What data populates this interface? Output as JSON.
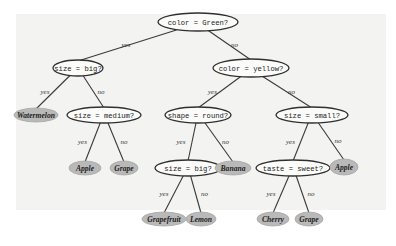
{
  "diagram": {
    "type": "decision-tree",
    "nodes": [
      {
        "id": "n0",
        "kind": "question",
        "label": "color = Green?"
      },
      {
        "id": "n1",
        "kind": "question",
        "label": "size = big?"
      },
      {
        "id": "n2",
        "kind": "question",
        "label": "color = yellow?"
      },
      {
        "id": "n3",
        "kind": "leaf",
        "label": "Watermelon"
      },
      {
        "id": "n4",
        "kind": "question",
        "label": "size = medium?"
      },
      {
        "id": "n5",
        "kind": "question",
        "label": "shape = round?"
      },
      {
        "id": "n6",
        "kind": "question",
        "label": "size = small?"
      },
      {
        "id": "n7",
        "kind": "leaf",
        "label": "Apple"
      },
      {
        "id": "n8",
        "kind": "leaf",
        "label": "Grape"
      },
      {
        "id": "n9",
        "kind": "question",
        "label": "size = big?"
      },
      {
        "id": "n10",
        "kind": "leaf",
        "label": "Banana"
      },
      {
        "id": "n11",
        "kind": "question",
        "label": "taste = sweet?"
      },
      {
        "id": "n12",
        "kind": "leaf",
        "label": "Apple"
      },
      {
        "id": "n13",
        "kind": "leaf",
        "label": "Grapefruit"
      },
      {
        "id": "n14",
        "kind": "leaf",
        "label": "Lemon"
      },
      {
        "id": "n15",
        "kind": "leaf",
        "label": "Cherry"
      },
      {
        "id": "n16",
        "kind": "leaf",
        "label": "Grape"
      }
    ],
    "edges": [
      {
        "from": "n0",
        "to": "n1",
        "label": "yes"
      },
      {
        "from": "n0",
        "to": "n2",
        "label": "no"
      },
      {
        "from": "n1",
        "to": "n3",
        "label": "yes"
      },
      {
        "from": "n1",
        "to": "n4",
        "label": "no"
      },
      {
        "from": "n2",
        "to": "n5",
        "label": "yes"
      },
      {
        "from": "n2",
        "to": "n6",
        "label": "no"
      },
      {
        "from": "n4",
        "to": "n7",
        "label": "yes"
      },
      {
        "from": "n4",
        "to": "n8",
        "label": "no"
      },
      {
        "from": "n5",
        "to": "n9",
        "label": "yes"
      },
      {
        "from": "n5",
        "to": "n10",
        "label": "no"
      },
      {
        "from": "n6",
        "to": "n11",
        "label": "yes"
      },
      {
        "from": "n6",
        "to": "n12",
        "label": "no"
      },
      {
        "from": "n9",
        "to": "n13",
        "label": "yes"
      },
      {
        "from": "n9",
        "to": "n14",
        "label": "no"
      },
      {
        "from": "n11",
        "to": "n15",
        "label": "yes"
      },
      {
        "from": "n11",
        "to": "n16",
        "label": "no"
      }
    ]
  }
}
